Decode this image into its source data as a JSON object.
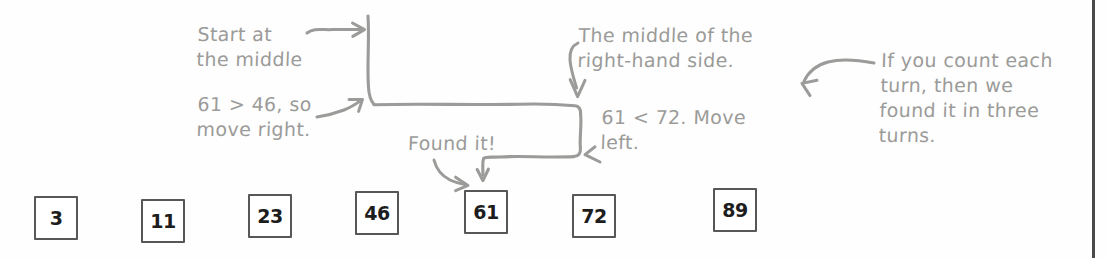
{
  "figure": {
    "type": "binary-search-diagram",
    "ink_color": "#9b9b99",
    "box_border_color": "#575757",
    "box_text_color": "#1d1d1d",
    "page_edge_color": "#4a4a4a"
  },
  "annotations": {
    "start_middle": "Start at\nthe middle",
    "move_right": "61 > 46, so\nmove right.",
    "right_hand_side": "The middle of the\nright-hand side.",
    "move_left": "61 < 72. Move\nleft.",
    "found_it": "Found it!",
    "three_turns": "If you count each\nturn, then we\nfound it in three\nturns."
  },
  "icons": {
    "arrow_right_to_start": "arrow-right-icon",
    "arrow_up_right_move_right": "arrow-up-right-icon",
    "arrow_down_to_right_middle": "arrow-down-icon",
    "arrow_left_move_left": "arrow-left-icon",
    "arrow_down_found_it": "arrow-down-icon",
    "arrow_curve_found_it": "arrow-curve-down-right-icon",
    "arrow_left_three_turns": "arrow-curve-left-icon"
  },
  "array": {
    "label": "sorted-value-list",
    "target": "61",
    "items": [
      {
        "value": "3",
        "x": 34,
        "highlighted": false
      },
      {
        "value": "11",
        "x": 141,
        "highlighted": false
      },
      {
        "value": "23",
        "x": 248,
        "highlighted": false
      },
      {
        "value": "46",
        "x": 355,
        "highlighted": false
      },
      {
        "value": "61",
        "x": 464,
        "highlighted": true
      },
      {
        "value": "72",
        "x": 572,
        "highlighted": false
      },
      {
        "value": "89",
        "x": 713,
        "highlighted": false
      }
    ]
  }
}
